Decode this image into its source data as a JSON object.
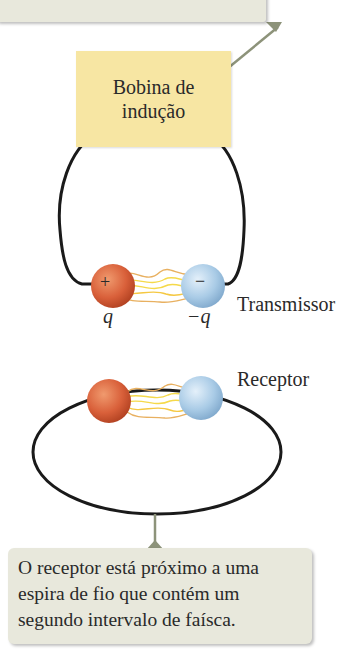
{
  "callouts": {
    "top": {
      "text": "eletrodos."
    },
    "bottom": {
      "lines": [
        "O receptor está próximo a uma",
        "espira de fio que contém um",
        "segundo intervalo de faísca."
      ]
    }
  },
  "coil": {
    "line1": "Bobina de",
    "line2": "indução"
  },
  "transmitter": {
    "label": "Transmissor",
    "positive_sign": "+",
    "negative_sign": "−",
    "positive_charge": "q",
    "negative_charge": "−q"
  },
  "receiver": {
    "label": "Receptor"
  },
  "colors": {
    "callout_bg": "#e8e8dc",
    "coil_bg": "#f7e6a3",
    "positive_sphere": "#d9603a",
    "negative_sphere": "#a9cbe6",
    "spark": "#f5d94a",
    "wire": "#1a1a1a",
    "pointer": "#8d937a"
  }
}
